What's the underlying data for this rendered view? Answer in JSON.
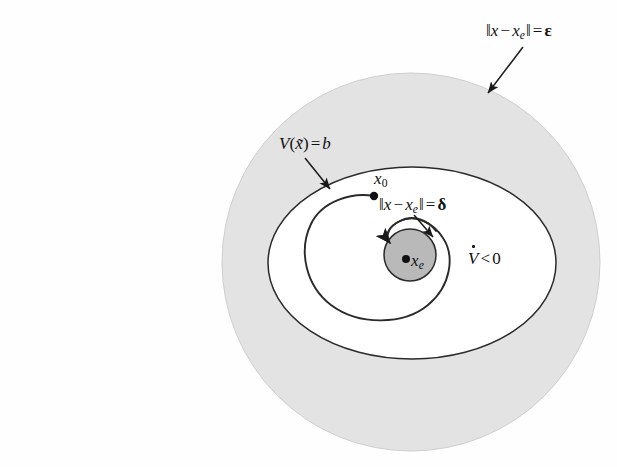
{
  "figure": {
    "name": "lyapunov-stability-diagram",
    "caption_text": "",
    "background_color": "#fefefe"
  },
  "colors": {
    "epsilon_region_fill": "#e2e2e2",
    "delta_region_fill": "#b8b8b8",
    "inner_region_fill": "#ffffff",
    "stroke": "#1a1a1a",
    "text": "#111111"
  },
  "regions": {
    "epsilon_ball": {
      "label": "epsilon-ball",
      "shape": "circle",
      "cx": 411,
      "cy": 262,
      "r": 189,
      "fill": "#e2e2e2"
    },
    "lyapunov_level_set": {
      "label": "lyapunov-level-set",
      "shape": "ellipse",
      "cx": 412,
      "cy": 263,
      "rx": 144,
      "ry": 96,
      "fill": "#ffffff"
    },
    "delta_ball": {
      "label": "delta-ball",
      "shape": "circle",
      "cx": 410,
      "cy": 255,
      "r": 26,
      "fill": "#b8b8b8"
    }
  },
  "points": {
    "x0": {
      "name": "initial-state-point",
      "cx": 374,
      "cy": 196,
      "r": 4.2
    },
    "xe": {
      "name": "equilibrium-point",
      "cx": 406,
      "cy": 259,
      "r": 4.0
    }
  },
  "labels": {
    "epsilon": {
      "id": "label-epsilon",
      "text_plain": "||x - x_e|| = ε",
      "norm_open": "‖",
      "var_x": "x",
      "minus": "−",
      "var_xe_base": "x",
      "var_xe_sub": "e",
      "norm_close": "‖",
      "equals": "=",
      "value": "ε"
    },
    "v_level": {
      "id": "label-v-level-set",
      "text_plain": "V(x̃) = b",
      "func": "V",
      "paren_open": "(",
      "arg": "x̃",
      "paren_close": ")",
      "equals": "=",
      "value": "b"
    },
    "x0": {
      "id": "label-x0",
      "text_plain": "x_0",
      "base": "x",
      "sub": "0"
    },
    "delta": {
      "id": "label-delta",
      "text_plain": "||x - x_e|| = δ",
      "norm_open": "‖",
      "var_x": "x",
      "minus": "−",
      "var_xe_base": "x",
      "var_xe_sub": "e",
      "norm_close": "‖",
      "equals": "=",
      "value": "δ"
    },
    "xe": {
      "id": "label-xe",
      "text_plain": "x_e",
      "base": "x",
      "sub": "e"
    },
    "vdot": {
      "id": "label-vdot",
      "text_plain": "V̇ < 0",
      "func": "V",
      "relation": "<",
      "value": "0"
    }
  },
  "arrows": {
    "epsilon_arrow": {
      "name": "epsilon-annotation-arrow",
      "from_x": 523,
      "from_y": 47,
      "to_x": 487,
      "to_y": 94
    },
    "v_level_arrow": {
      "name": "v-level-annotation-arrow",
      "from_x": 306,
      "from_y": 159,
      "to_x": 330,
      "to_y": 188
    },
    "delta_arrow": {
      "name": "delta-annotation-arrow",
      "from_x": 415,
      "from_y": 216,
      "to_x": 432,
      "to_y": 236
    }
  },
  "trajectory": {
    "name": "state-trajectory",
    "description": "spiral converging from x0 into the delta ball",
    "start_x": 374,
    "start_y": 196,
    "end_x": 390,
    "end_y": 243,
    "arrowhead": "pointing-left-into-delta-ball"
  }
}
